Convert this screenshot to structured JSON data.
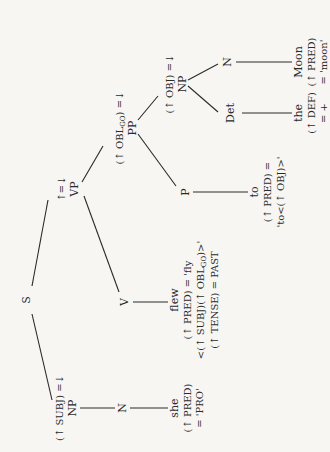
{
  "tree": {
    "root": "S",
    "nodes": {
      "s": {
        "label": "S"
      },
      "np_subj": {
        "label": "NP",
        "annotation": "(↑ SUBJ) =↓"
      },
      "n_subj": {
        "label": "N"
      },
      "she": {
        "word": "she",
        "f1": "(↑ PRED)",
        "f2": "= 'PRO'"
      },
      "vp": {
        "label": "VP",
        "annotation": "↑=↓"
      },
      "v": {
        "label": "V"
      },
      "flew": {
        "word": "flew",
        "f1": "(↑ PRED) = 'fly",
        "f2a": "<(↑ SUBJ)(↑ OBL",
        "f2sub": "GO",
        "f2b": ")>'",
        "f3": "(↑ TENSE) = PAST"
      },
      "pp": {
        "label": "PP",
        "annotation_a": "(↑ OBL",
        "annotation_sub": "GO",
        "annotation_b": ") =↓"
      },
      "p": {
        "label": "P"
      },
      "to": {
        "word": "to",
        "f1": "(↑ PRED) =",
        "f2": "'to<(↑ OBJ)>'"
      },
      "np_obj": {
        "label": "NP",
        "annotation": "(↑ OBJ) =↓"
      },
      "det": {
        "label": "Det"
      },
      "the": {
        "word": "the",
        "f1": "(↑ DEF)",
        "f2": "= +"
      },
      "n_obj": {
        "label": "N"
      },
      "moon": {
        "word": "Moon",
        "f1": "(↑ PRED)",
        "f2": "= 'moon'"
      }
    }
  }
}
